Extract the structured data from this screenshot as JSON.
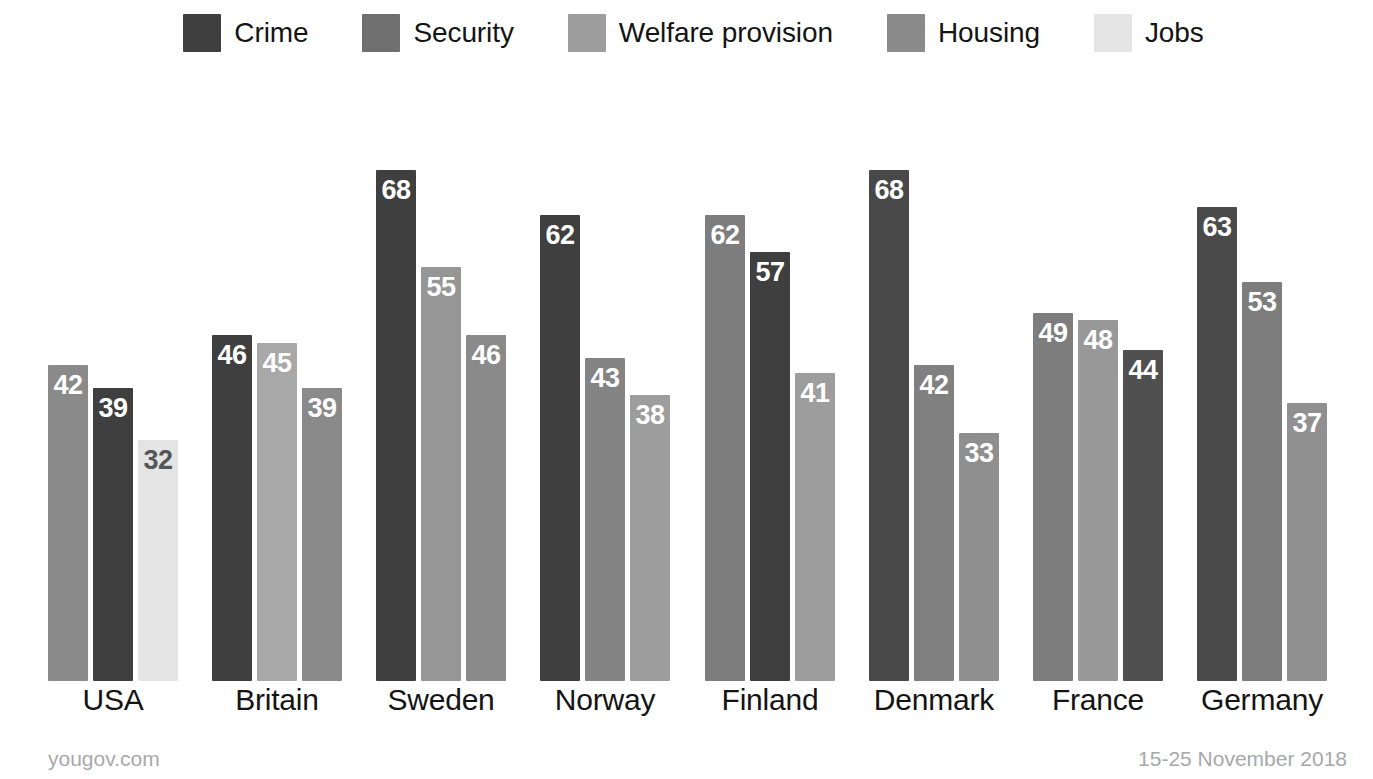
{
  "legend": {
    "items": [
      {
        "label": "Crime",
        "key": "crime",
        "color": "#3f3f3f"
      },
      {
        "label": "Security",
        "key": "security",
        "color": "#6f6f6f"
      },
      {
        "label": "Welfare provision",
        "key": "welfare",
        "color": "#9d9d9d"
      },
      {
        "label": "Housing",
        "key": "housing",
        "color": "#8a8a8a"
      },
      {
        "label": "Jobs",
        "key": "jobs",
        "color": "#e4e4e4"
      }
    ]
  },
  "footer": {
    "source": "yougov.com",
    "date_range": "15-25 November 2018"
  },
  "chart_data": {
    "type": "bar",
    "title": "",
    "xlabel": "",
    "ylabel": "",
    "ylim": [
      0,
      72
    ],
    "grid": false,
    "legend_position": "top",
    "categories": [
      "USA",
      "Britain",
      "Sweden",
      "Norway",
      "Finland",
      "Denmark",
      "France",
      "Germany"
    ],
    "series_names": [
      "Crime",
      "Security",
      "Welfare provision",
      "Housing",
      "Jobs"
    ],
    "groups": [
      {
        "category": "USA",
        "bars": [
          {
            "series": "Housing",
            "value": 42,
            "color": "#8a8a8a"
          },
          {
            "series": "Crime",
            "value": 39,
            "color": "#3f3f3f"
          },
          {
            "series": "Jobs",
            "value": 32,
            "color": "#e4e4e4"
          }
        ]
      },
      {
        "category": "Britain",
        "bars": [
          {
            "series": "Crime",
            "value": 46,
            "color": "#3f3f3f"
          },
          {
            "series": "Welfare provision",
            "value": 45,
            "color": "#a8a8a8"
          },
          {
            "series": "Housing",
            "value": 39,
            "color": "#8a8a8a"
          }
        ]
      },
      {
        "category": "Sweden",
        "bars": [
          {
            "series": "Crime",
            "value": 68,
            "color": "#3f3f3f"
          },
          {
            "series": "Welfare provision",
            "value": 55,
            "color": "#969696"
          },
          {
            "series": "Housing",
            "value": 46,
            "color": "#8a8a8a"
          }
        ]
      },
      {
        "category": "Norway",
        "bars": [
          {
            "series": "Crime",
            "value": 62,
            "color": "#3f3f3f"
          },
          {
            "series": "Housing",
            "value": 43,
            "color": "#848484"
          },
          {
            "series": "Welfare provision",
            "value": 38,
            "color": "#9d9d9d"
          }
        ]
      },
      {
        "category": "Finland",
        "bars": [
          {
            "series": "Security",
            "value": 62,
            "color": "#7d7d7d"
          },
          {
            "series": "Crime",
            "value": 57,
            "color": "#3f3f3f"
          },
          {
            "series": "Welfare provision",
            "value": 41,
            "color": "#9d9d9d"
          }
        ]
      },
      {
        "category": "Denmark",
        "bars": [
          {
            "series": "Crime",
            "value": 68,
            "color": "#484848"
          },
          {
            "series": "Security",
            "value": 42,
            "color": "#808080"
          },
          {
            "series": "Welfare provision",
            "value": 33,
            "color": "#8f8f8f"
          }
        ]
      },
      {
        "category": "France",
        "bars": [
          {
            "series": "Security",
            "value": 49,
            "color": "#7d7d7d"
          },
          {
            "series": "Welfare provision",
            "value": 48,
            "color": "#989898"
          },
          {
            "series": "Crime",
            "value": 44,
            "color": "#505050"
          }
        ]
      },
      {
        "category": "Germany",
        "bars": [
          {
            "series": "Crime",
            "value": 63,
            "color": "#4a4a4a"
          },
          {
            "series": "Security",
            "value": 53,
            "color": "#7d7d7d"
          },
          {
            "series": "Welfare provision",
            "value": 37,
            "color": "#909090"
          }
        ]
      }
    ]
  },
  "geometry": {
    "group_left_positions": [
      48,
      212,
      376,
      540,
      705,
      869,
      1033,
      1197
    ],
    "group_width": 130,
    "bar_width": 40,
    "bar_gap": 5,
    "px_per_unit": 7.52,
    "baseline_y": 615
  }
}
